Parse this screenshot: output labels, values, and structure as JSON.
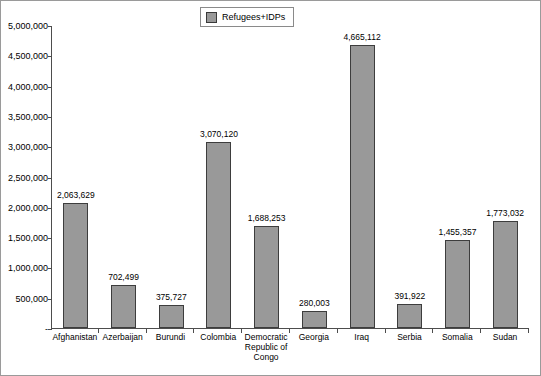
{
  "chart_data": {
    "type": "bar",
    "title": "",
    "xlabel": "",
    "ylabel": "",
    "ylim": [
      0,
      5000000
    ],
    "ytick_step": 500000,
    "grid": false,
    "legend_position": "top-center",
    "legend": [
      "Refugees+IDPs"
    ],
    "categories": [
      "Afghanistan",
      "Azerbaijan",
      "Burundi",
      "Colombia",
      "Democratic Republic of Congo",
      "Georgia",
      "Iraq",
      "Serbia",
      "Somalia",
      "Sudan"
    ],
    "values": [
      2063629,
      702499,
      375727,
      3070120,
      1688253,
      280003,
      4665112,
      391922,
      1455357,
      1773032
    ],
    "value_labels": [
      "2,063,629",
      "702,499",
      "375,727",
      "3,070,120",
      "1,688,253",
      "280,003",
      "4,665,112",
      "391,922",
      "1,455,357",
      "1,773,032"
    ],
    "ytick_labels": [
      "5,000,000",
      "4,500,000",
      "4,000,000",
      "3,500,000",
      "3,000,000",
      "2,500,000",
      "2,000,000",
      "1,500,000",
      "1,000,000",
      "500,000",
      "-"
    ],
    "ytick_values": [
      5000000,
      4500000,
      4000000,
      3500000,
      3000000,
      2500000,
      2000000,
      1500000,
      1000000,
      500000,
      0
    ],
    "colors": {
      "bar_fill": "#999999",
      "bar_border": "#3d3d3d",
      "axis": "#4d4d4d",
      "text": "#000000",
      "background": "#ffffff",
      "frame": "#9a9a9a"
    }
  },
  "legend": {
    "series_label": "Refugees+IDPs"
  }
}
